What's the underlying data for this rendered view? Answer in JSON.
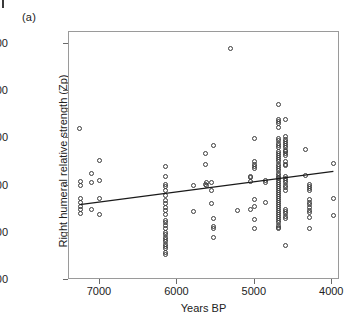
{
  "panel": {
    "label": "(a)"
  },
  "chart_data": {
    "type": "scatter",
    "title": "",
    "xlabel": "Years BP",
    "ylabel": "Right humeral relative strength (Zp)",
    "xlim": [
      7400,
      3900
    ],
    "ylim": [
      200,
      1250
    ],
    "x_reversed": true,
    "grid": false,
    "legend": null,
    "xticks": [
      7000,
      6000,
      5000,
      4000
    ],
    "xtick_labels": [
      "7000",
      "6000",
      "5000",
      "4000"
    ],
    "yticks": [
      200,
      400,
      600,
      800,
      1000,
      1200
    ],
    "ytick_labels": [
      "200",
      "400",
      "600",
      "800",
      "1000",
      "1200"
    ],
    "marker": "open-circle",
    "marker_color": "#3b3b3b",
    "line_color": "#1a1a1a",
    "trendline": {
      "type": "linear-fit",
      "x_start": 7260,
      "y_start": 513,
      "x_end": 3960,
      "y_end": 655
    },
    "points": [
      [
        7260,
        843
      ],
      [
        7250,
        618
      ],
      [
        7250,
        600
      ],
      [
        7250,
        543
      ],
      [
        7250,
        528
      ],
      [
        7250,
        513
      ],
      [
        7250,
        497
      ],
      [
        7250,
        480
      ],
      [
        7110,
        650
      ],
      [
        7110,
        612
      ],
      [
        7110,
        497
      ],
      [
        7010,
        705
      ],
      [
        7010,
        620
      ],
      [
        7010,
        546
      ],
      [
        7010,
        477
      ],
      [
        6150,
        680
      ],
      [
        6150,
        640
      ],
      [
        6150,
        606
      ],
      [
        6150,
        596
      ],
      [
        6150,
        578
      ],
      [
        6150,
        556
      ],
      [
        6150,
        535
      ],
      [
        6150,
        524
      ],
      [
        6150,
        508
      ],
      [
        6150,
        495
      ],
      [
        6150,
        476
      ],
      [
        6150,
        452
      ],
      [
        6150,
        442
      ],
      [
        6150,
        432
      ],
      [
        6150,
        420
      ],
      [
        6150,
        400
      ],
      [
        6150,
        392
      ],
      [
        6150,
        382
      ],
      [
        6150,
        372
      ],
      [
        6150,
        362
      ],
      [
        6150,
        352
      ],
      [
        6150,
        342
      ],
      [
        6150,
        332
      ],
      [
        6150,
        318
      ],
      [
        6150,
        310
      ],
      [
        5790,
        601
      ],
      [
        5790,
        489
      ],
      [
        5640,
        736
      ],
      [
        5640,
        691
      ],
      [
        5640,
        604
      ],
      [
        5620,
        612
      ],
      [
        5620,
        598
      ],
      [
        5560,
        611
      ],
      [
        5560,
        578
      ],
      [
        5560,
        523
      ],
      [
        5540,
        768
      ],
      [
        5540,
        462
      ],
      [
        5540,
        426
      ],
      [
        5540,
        418
      ],
      [
        5540,
        380
      ],
      [
        5310,
        1180
      ],
      [
        5220,
        493
      ],
      [
        5050,
        640
      ],
      [
        5050,
        636
      ],
      [
        5050,
        618
      ],
      [
        5050,
        497
      ],
      [
        5000,
        798
      ],
      [
        5000,
        700
      ],
      [
        5000,
        688
      ],
      [
        5000,
        680
      ],
      [
        5000,
        674
      ],
      [
        5000,
        540
      ],
      [
        5000,
        510
      ],
      [
        5000,
        455
      ],
      [
        5000,
        420
      ],
      [
        4860,
        620
      ],
      [
        4860,
        611
      ],
      [
        4860,
        530
      ],
      [
        4700,
        944
      ],
      [
        4690,
        880
      ],
      [
        4690,
        872
      ],
      [
        4690,
        862
      ],
      [
        4690,
        845
      ],
      [
        4690,
        800
      ],
      [
        4690,
        792
      ],
      [
        4690,
        780
      ],
      [
        4690,
        770
      ],
      [
        4690,
        762
      ],
      [
        4690,
        744
      ],
      [
        4690,
        736
      ],
      [
        4690,
        728
      ],
      [
        4690,
        720
      ],
      [
        4690,
        712
      ],
      [
        4690,
        700
      ],
      [
        4690,
        690
      ],
      [
        4690,
        682
      ],
      [
        4690,
        672
      ],
      [
        4690,
        664
      ],
      [
        4690,
        652
      ],
      [
        4690,
        644
      ],
      [
        4690,
        636
      ],
      [
        4690,
        628
      ],
      [
        4690,
        620
      ],
      [
        4690,
        612
      ],
      [
        4690,
        604
      ],
      [
        4690,
        596
      ],
      [
        4690,
        588
      ],
      [
        4690,
        580
      ],
      [
        4690,
        570
      ],
      [
        4690,
        562
      ],
      [
        4690,
        554
      ],
      [
        4690,
        546
      ],
      [
        4690,
        538
      ],
      [
        4690,
        528
      ],
      [
        4690,
        520
      ],
      [
        4690,
        512
      ],
      [
        4690,
        504
      ],
      [
        4690,
        496
      ],
      [
        4690,
        486
      ],
      [
        4690,
        478
      ],
      [
        4690,
        470
      ],
      [
        4690,
        462
      ],
      [
        4690,
        454
      ],
      [
        4690,
        444
      ],
      [
        4690,
        432
      ],
      [
        4690,
        424
      ],
      [
        4690,
        416
      ],
      [
        4610,
        878
      ],
      [
        4610,
        806
      ],
      [
        4610,
        795
      ],
      [
        4610,
        788
      ],
      [
        4610,
        780
      ],
      [
        4610,
        770
      ],
      [
        4610,
        760
      ],
      [
        4610,
        750
      ],
      [
        4610,
        742
      ],
      [
        4610,
        734
      ],
      [
        4610,
        726
      ],
      [
        4610,
        700
      ],
      [
        4610,
        690
      ],
      [
        4610,
        684
      ],
      [
        4610,
        640
      ],
      [
        4610,
        630
      ],
      [
        4610,
        622
      ],
      [
        4610,
        612
      ],
      [
        4610,
        600
      ],
      [
        4610,
        590
      ],
      [
        4610,
        580
      ],
      [
        4610,
        500
      ],
      [
        4610,
        490
      ],
      [
        4610,
        480
      ],
      [
        4610,
        470
      ],
      [
        4610,
        462
      ],
      [
        4610,
        345
      ],
      [
        4340,
        752
      ],
      [
        4340,
        644
      ],
      [
        4300,
        604
      ],
      [
        4300,
        596
      ],
      [
        4300,
        588
      ],
      [
        4300,
        580
      ],
      [
        4300,
        540
      ],
      [
        4300,
        530
      ],
      [
        4300,
        520
      ],
      [
        4300,
        508
      ],
      [
        4300,
        496
      ],
      [
        4300,
        486
      ],
      [
        4300,
        464
      ],
      [
        4300,
        420
      ],
      [
        3980,
        695
      ],
      [
        3980,
        546
      ],
      [
        3980,
        472
      ]
    ]
  }
}
